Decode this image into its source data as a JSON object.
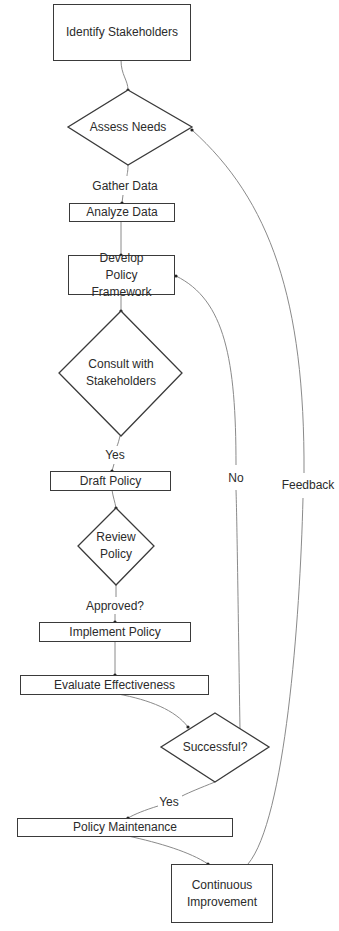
{
  "diagram": {
    "type": "flowchart",
    "nodes": {
      "identify": {
        "label": "Identify Stakeholders",
        "shape": "rectangle"
      },
      "assess": {
        "label": "Assess Needs",
        "shape": "diamond"
      },
      "analyze": {
        "label": "Analyze Data",
        "shape": "rectangle"
      },
      "develop": {
        "label": "Develop Policy Framework",
        "shape": "rectangle"
      },
      "consult": {
        "label": "Consult with Stakeholders",
        "shape": "diamond"
      },
      "draft": {
        "label": "Draft Policy",
        "shape": "rectangle"
      },
      "review": {
        "label": "Review Policy",
        "shape": "diamond"
      },
      "implement": {
        "label": "Implement Policy",
        "shape": "rectangle"
      },
      "evaluate": {
        "label": "Evaluate Effectiveness",
        "shape": "rectangle"
      },
      "successful": {
        "label": "Successful?",
        "shape": "diamond"
      },
      "maintenance": {
        "label": "Policy Maintenance",
        "shape": "rectangle"
      },
      "improvement": {
        "label": "Continuous Improvement",
        "shape": "rectangle"
      }
    },
    "edge_labels": {
      "gather": "Gather Data",
      "yes_consult": "Yes",
      "approved": "Approved?",
      "yes_success": "Yes",
      "no": "No",
      "feedback": "Feedback"
    },
    "edges": [
      {
        "from": "Identify Stakeholders",
        "to": "Assess Needs",
        "label": ""
      },
      {
        "from": "Assess Needs",
        "to": "Analyze Data",
        "label": "Gather Data"
      },
      {
        "from": "Analyze Data",
        "to": "Develop Policy Framework",
        "label": ""
      },
      {
        "from": "Develop Policy Framework",
        "to": "Consult with Stakeholders",
        "label": ""
      },
      {
        "from": "Consult with Stakeholders",
        "to": "Draft Policy",
        "label": "Yes"
      },
      {
        "from": "Draft Policy",
        "to": "Review Policy",
        "label": ""
      },
      {
        "from": "Review Policy",
        "to": "Implement Policy",
        "label": "Approved?"
      },
      {
        "from": "Implement Policy",
        "to": "Evaluate Effectiveness",
        "label": ""
      },
      {
        "from": "Evaluate Effectiveness",
        "to": "Successful?",
        "label": ""
      },
      {
        "from": "Successful?",
        "to": "Policy Maintenance",
        "label": "Yes"
      },
      {
        "from": "Successful?",
        "to": "Develop Policy Framework",
        "label": "No"
      },
      {
        "from": "Policy Maintenance",
        "to": "Continuous Improvement",
        "label": ""
      },
      {
        "from": "Continuous Improvement",
        "to": "Assess Needs",
        "label": "Feedback"
      }
    ],
    "colors": {
      "stroke": "#3a3a3a",
      "edge": "#8a8a8a",
      "text": "#2b2b2b",
      "background": "#ffffff"
    }
  }
}
